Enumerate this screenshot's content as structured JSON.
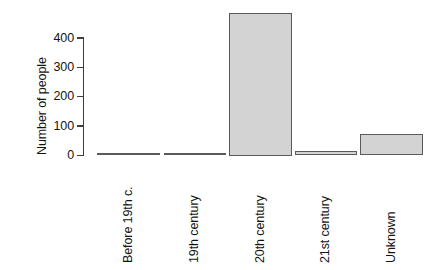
{
  "chart_data": {
    "type": "bar",
    "title": "",
    "subtitle": "",
    "xlabel": "",
    "ylabel": "Number of people",
    "categories": [
      "Before 19th c.",
      "19th century",
      "20th century",
      "21st century",
      "Unknown"
    ],
    "values": [
      3,
      8,
      485,
      17,
      72
    ],
    "ylim": [
      0,
      500
    ],
    "yticks": [
      0,
      100,
      200,
      300,
      400
    ],
    "ytick_labels": [
      "0",
      "100",
      "200",
      "300",
      "400"
    ],
    "grid": false,
    "legend": null,
    "legend_position": "none",
    "annotations": [],
    "bar_fill_color": "#d3d3d3",
    "bar_border_color": "#5a5a5a",
    "axis_color": "#3d3d3d",
    "text_color": "#141414",
    "background_color": "#ffffff",
    "x_labels_rotation_degrees": 90
  }
}
